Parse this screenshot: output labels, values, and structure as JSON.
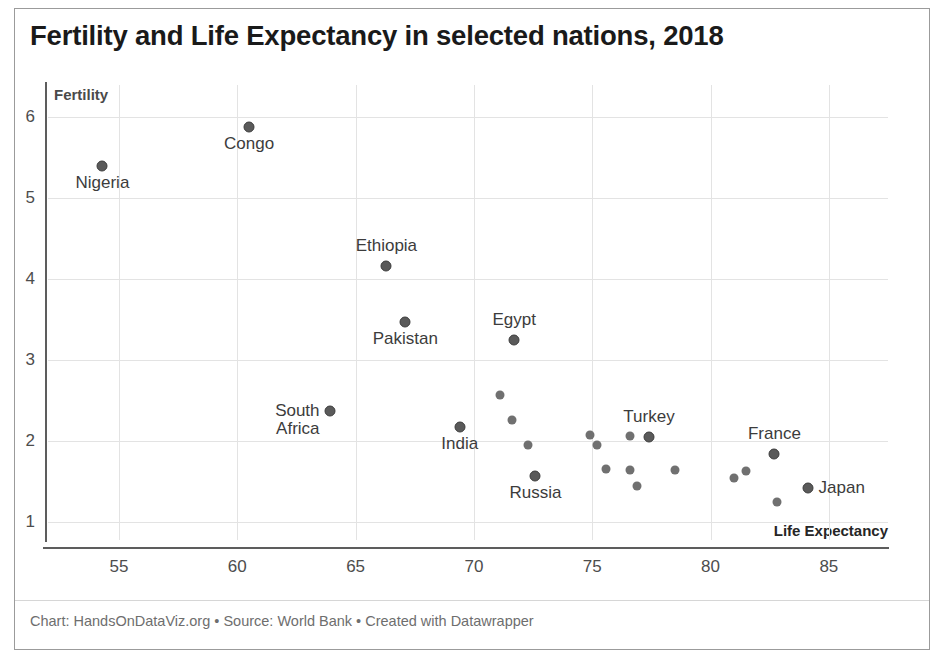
{
  "title": "Fertility and Life Expectancy in selected nations, 2018",
  "footer": "Chart: HandsOnDataViz.org • Source: World Bank • Created with Datawrapper",
  "axis": {
    "y_name": "Fertility",
    "x_name": "Life Expectancy"
  },
  "colors": {
    "dot": "#707070",
    "dot_labeled": "#5a5a5a",
    "grid": "#e3e3e3",
    "axis": "#5d5d5d",
    "title": "#1a1a1a",
    "footer": "#6e6e6e"
  },
  "chart_data": {
    "type": "scatter",
    "title": "Fertility and Life Expectancy in selected nations, 2018",
    "xlabel": "Life Expectancy",
    "ylabel": "Fertility",
    "xlim": [
      52,
      87.5
    ],
    "ylim": [
      0.78,
      6.4
    ],
    "xticks": [
      55,
      60,
      65,
      70,
      75,
      80,
      85
    ],
    "yticks": [
      1,
      2,
      3,
      4,
      5,
      6
    ],
    "grid": true,
    "legend": "none",
    "points": [
      {
        "label": "Nigeria",
        "x": 54.3,
        "y": 5.4,
        "label_pos": "below",
        "labeled": true
      },
      {
        "label": "Congo",
        "x": 60.5,
        "y": 5.88,
        "label_pos": "below",
        "labeled": true
      },
      {
        "label": "Ethiopia",
        "x": 66.3,
        "y": 4.17,
        "label_pos": "above",
        "labeled": true
      },
      {
        "label": "Pakistan",
        "x": 67.1,
        "y": 3.47,
        "label_pos": "below",
        "labeled": true
      },
      {
        "label": "Egypt",
        "x": 71.7,
        "y": 3.25,
        "label_pos": "above",
        "labeled": true
      },
      {
        "label": "South\nAfrica",
        "x": 63.9,
        "y": 2.37,
        "label_pos": "left",
        "labeled": true
      },
      {
        "label": "India",
        "x": 69.4,
        "y": 2.18,
        "label_pos": "below",
        "labeled": true
      },
      {
        "label": "Russia",
        "x": 72.6,
        "y": 1.57,
        "label_pos": "below",
        "labeled": true
      },
      {
        "label": "Turkey",
        "x": 77.4,
        "y": 2.05,
        "label_pos": "above",
        "labeled": true
      },
      {
        "label": "France",
        "x": 82.7,
        "y": 1.84,
        "label_pos": "above",
        "labeled": true
      },
      {
        "label": "Japan",
        "x": 84.1,
        "y": 1.42,
        "label_pos": "right",
        "labeled": true
      },
      {
        "label": "",
        "x": 71.1,
        "y": 2.57,
        "labeled": false
      },
      {
        "label": "",
        "x": 71.6,
        "y": 2.26,
        "labeled": false
      },
      {
        "label": "",
        "x": 72.3,
        "y": 1.95,
        "labeled": false
      },
      {
        "label": "",
        "x": 74.9,
        "y": 2.08,
        "labeled": false
      },
      {
        "label": "",
        "x": 75.2,
        "y": 1.95,
        "labeled": false
      },
      {
        "label": "",
        "x": 75.6,
        "y": 1.66,
        "labeled": false
      },
      {
        "label": "",
        "x": 76.6,
        "y": 2.06,
        "labeled": false
      },
      {
        "label": "",
        "x": 76.6,
        "y": 1.65,
        "labeled": false
      },
      {
        "label": "",
        "x": 76.9,
        "y": 1.45,
        "labeled": false
      },
      {
        "label": "",
        "x": 78.5,
        "y": 1.64,
        "labeled": false
      },
      {
        "label": "",
        "x": 81.0,
        "y": 1.55,
        "labeled": false
      },
      {
        "label": "",
        "x": 81.5,
        "y": 1.63,
        "labeled": false
      },
      {
        "label": "",
        "x": 82.8,
        "y": 1.25,
        "labeled": false
      }
    ]
  }
}
